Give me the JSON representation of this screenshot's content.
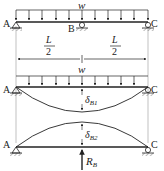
{
  "figure": {
    "panel1": {
      "load_label": "w",
      "point_a": "A",
      "point_b": "B",
      "point_c": "C",
      "dim_left": {
        "num": "L",
        "den": "2"
      },
      "dim_right": {
        "num": "L",
        "den": "2"
      }
    },
    "panel2": {
      "load_label": "w",
      "point_a": "A",
      "point_c": "C",
      "deflection_label": {
        "base": "δ",
        "sub": "B1"
      }
    },
    "panel3": {
      "point_a": "A",
      "point_c": "C",
      "deflection_label": {
        "base": "δ",
        "sub": "B2"
      },
      "reaction_label": {
        "base": "R",
        "sub": "B"
      }
    },
    "colors": {
      "line": "#222222",
      "guide": "#888888",
      "background": "#ffffff"
    }
  }
}
